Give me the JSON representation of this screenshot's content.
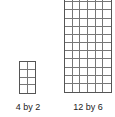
{
  "figures": [
    {
      "label": "4 by 2",
      "rows": 4,
      "cols": 2
    },
    {
      "label": "12 by 6",
      "rows": 12,
      "cols": 6
    }
  ]
}
